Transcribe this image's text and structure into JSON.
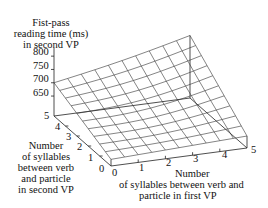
{
  "chart_data": {
    "type": "surface3d",
    "title": "",
    "zlabel": [
      "Fist-pass",
      "reading time (ms)",
      "in second VP"
    ],
    "xlabel": [
      "Number",
      "of syllables between verb and",
      "particle in first VP"
    ],
    "ylabel": [
      "Number",
      "of syllables",
      "between verb",
      "and particle",
      "in second VP"
    ],
    "x_ticks": [
      "0",
      "1",
      "2",
      "3",
      "4",
      "5"
    ],
    "y_ticks": [
      "0",
      "1",
      "2",
      "3",
      "4",
      "5"
    ],
    "z_ticks": [
      "650",
      "700",
      "750",
      "800"
    ],
    "zlim": [
      600,
      820
    ],
    "x": [
      0,
      0.5,
      1,
      1.5,
      2,
      2.5,
      3,
      3.5,
      4,
      4.5,
      5
    ],
    "y": [
      0,
      0.5,
      1,
      1.5,
      2,
      2.5,
      3,
      3.5,
      4,
      4.5,
      5
    ],
    "corner_values": {
      "x0_y0": 600,
      "x5_y0": 620,
      "x0_y5": 700,
      "x5_y5": 810
    },
    "grid": false,
    "legend": null
  }
}
